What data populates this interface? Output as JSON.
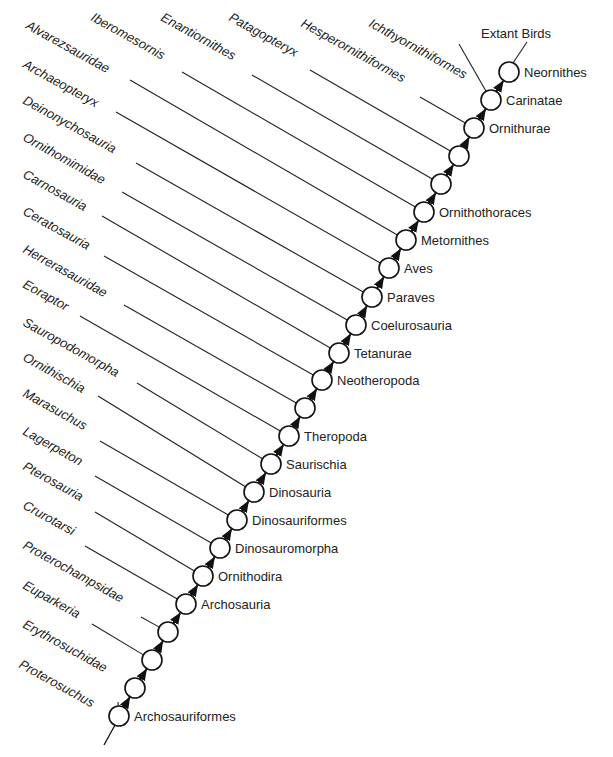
{
  "chart_data": {
    "type": "cladogram",
    "title": "",
    "root_label": "",
    "extant_label": "Extant Birds",
    "nodes": [
      {
        "x": 119,
        "y": 716,
        "label": "Archosauriformes"
      },
      {
        "x": 135,
        "y": 688,
        "label": ""
      },
      {
        "x": 152,
        "y": 660,
        "label": ""
      },
      {
        "x": 168,
        "y": 632,
        "label": ""
      },
      {
        "x": 186,
        "y": 604,
        "label": "Archosauria"
      },
      {
        "x": 203,
        "y": 576,
        "label": "Ornithodira"
      },
      {
        "x": 220,
        "y": 548,
        "label": "Dinosauromorpha"
      },
      {
        "x": 237,
        "y": 520,
        "label": "Dinosauriformes"
      },
      {
        "x": 254,
        "y": 492,
        "label": "Dinosauria"
      },
      {
        "x": 271,
        "y": 464,
        "label": "Saurischia"
      },
      {
        "x": 289,
        "y": 436,
        "label": "Theropoda"
      },
      {
        "x": 305,
        "y": 408,
        "label": ""
      },
      {
        "x": 322,
        "y": 380,
        "label": "Neotheropoda"
      },
      {
        "x": 339,
        "y": 353,
        "label": "Tetanurae"
      },
      {
        "x": 356,
        "y": 325,
        "label": "Coelurosauria"
      },
      {
        "x": 372,
        "y": 297,
        "label": "Paraves"
      },
      {
        "x": 389,
        "y": 268,
        "label": "Aves"
      },
      {
        "x": 406,
        "y": 240,
        "label": "Metornithes"
      },
      {
        "x": 424,
        "y": 212,
        "label": "Ornithothoraces"
      },
      {
        "x": 441,
        "y": 184,
        "label": ""
      },
      {
        "x": 459,
        "y": 156,
        "label": ""
      },
      {
        "x": 474,
        "y": 128,
        "label": "Ornithurae"
      },
      {
        "x": 491,
        "y": 100,
        "label": "Carinatae"
      },
      {
        "x": 509,
        "y": 72,
        "label": "Neornithes"
      }
    ],
    "terminals": [
      {
        "name": "Proterosuchus",
        "tx": 18,
        "ty": 667,
        "lx1": 118,
        "ly1": 702,
        "node": 0
      },
      {
        "name": "Erythrosuchidae",
        "tx": 22,
        "ty": 627,
        "lx1": 126,
        "ly1": 683,
        "node": 1
      },
      {
        "name": "Euparkeria",
        "tx": 22,
        "ty": 588,
        "lx1": 92,
        "ly1": 624,
        "node": 2
      },
      {
        "name": "Proterochampsidae",
        "tx": 22,
        "ty": 548,
        "lx1": 141,
        "ly1": 617,
        "node": 3
      },
      {
        "name": "Crurotarsi",
        "tx": 22,
        "ty": 508,
        "lx1": 85,
        "ly1": 546,
        "node": 4
      },
      {
        "name": "Pterosauria",
        "tx": 22,
        "ty": 469,
        "lx1": 95,
        "ly1": 512,
        "node": 5
      },
      {
        "name": "Lagerpeton",
        "tx": 22,
        "ty": 434,
        "lx1": 95,
        "ly1": 476,
        "node": 6
      },
      {
        "name": "Marasuchus",
        "tx": 22,
        "ty": 396,
        "lx1": 100,
        "ly1": 441,
        "node": 7
      },
      {
        "name": "Ornithischia",
        "tx": 22,
        "ty": 360,
        "lx1": 98,
        "ly1": 396,
        "node": 8
      },
      {
        "name": "Sauropodomorpha",
        "tx": 22,
        "ty": 325,
        "lx1": 137,
        "ly1": 383,
        "node": 9
      },
      {
        "name": "Eoraptor",
        "tx": 22,
        "ty": 287,
        "lx1": 80,
        "ly1": 316,
        "node": 10
      },
      {
        "name": "Herrerasauridae",
        "tx": 22,
        "ty": 252,
        "lx1": 124,
        "ly1": 305,
        "node": 11
      },
      {
        "name": "Ceratosauria",
        "tx": 22,
        "ty": 214,
        "lx1": 104,
        "ly1": 256,
        "node": 12
      },
      {
        "name": "Carnosauria",
        "tx": 22,
        "ty": 177,
        "lx1": 102,
        "ly1": 216,
        "node": 13
      },
      {
        "name": "Ornithomimidae",
        "tx": 22,
        "ty": 140,
        "lx1": 122,
        "ly1": 192,
        "node": 14
      },
      {
        "name": "Deinonychosauria",
        "tx": 22,
        "ty": 103,
        "lx1": 136,
        "ly1": 163,
        "node": 15
      },
      {
        "name": "Archaeopteryx",
        "tx": 22,
        "ty": 67,
        "lx1": 116,
        "ly1": 112,
        "node": 16
      },
      {
        "name": "Alvarezsauridae",
        "tx": 25,
        "ty": 28,
        "lx1": 130,
        "ly1": 80,
        "node": 17
      },
      {
        "name": "Iberomesornis",
        "tx": 90,
        "ty": 20,
        "lx1": 182,
        "ly1": 72,
        "node": 18
      },
      {
        "name": "Enantiornithes",
        "tx": 160,
        "ty": 20,
        "lx1": 252,
        "ly1": 75,
        "node": 19
      },
      {
        "name": "Patagopteryx",
        "tx": 228,
        "ty": 20,
        "lx1": 310,
        "ly1": 70,
        "node": 20
      },
      {
        "name": "Hesperornithiformes",
        "tx": 300,
        "ty": 26,
        "lx1": 420,
        "ly1": 97,
        "node": 21
      },
      {
        "name": "Ichthyornithiformes",
        "tx": 368,
        "ty": 26,
        "lx1": 459,
        "ly1": 44,
        "node": 22
      }
    ]
  }
}
